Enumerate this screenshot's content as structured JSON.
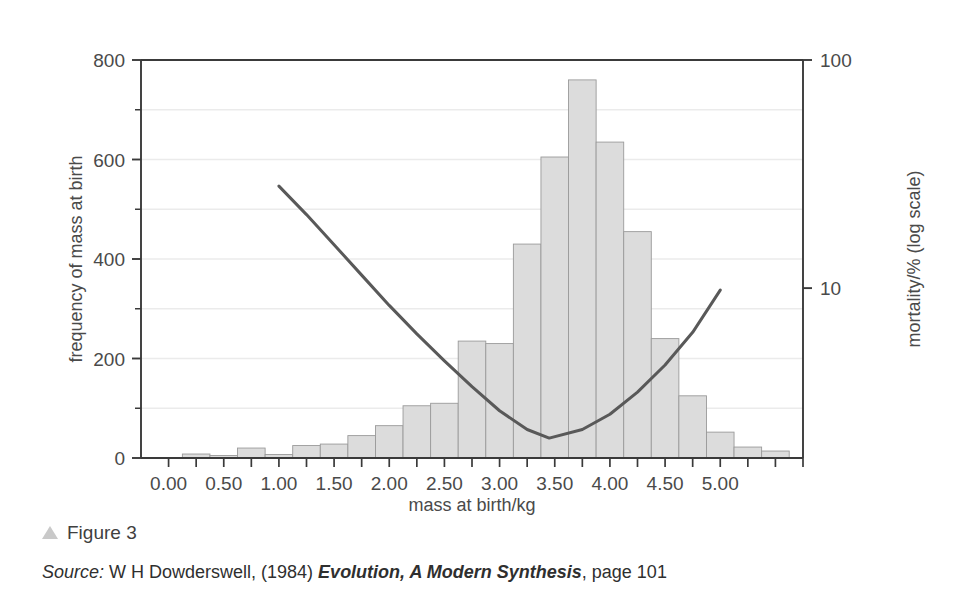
{
  "figure": {
    "marker_icon": "triangle-up-icon",
    "label": "Figure 3"
  },
  "source": {
    "prefix": "Source:",
    "author": " W H Dowderswell, (1984) ",
    "work": "Evolution, A Modern Synthesis",
    "suffix": ", page 101"
  },
  "colors": {
    "bar_fill": "#dcdcdc",
    "bar_stroke": "#9a9a9a",
    "curve": "#595959",
    "axis": "#3a3a3a",
    "grid": "#ebebeb",
    "text": "#4a4a4a",
    "marker": "#c9c9c9"
  },
  "chart_data": {
    "type": "bar",
    "title": "",
    "subtitle": "",
    "xlabel": "mass at birth/kg",
    "ylabel": "frequency of mass at birth",
    "y2label": "mortality/% (log scale)",
    "xlim": [
      -0.25,
      5.75
    ],
    "ylim": [
      0,
      800
    ],
    "y2lim": [
      1.8,
      100
    ],
    "y2scale": "log",
    "grid": true,
    "grid_step": 100,
    "legend": "none",
    "xticks": [
      0.0,
      0.25,
      0.5,
      0.75,
      1.0,
      1.25,
      1.5,
      1.75,
      2.0,
      2.25,
      2.5,
      2.75,
      3.0,
      3.25,
      3.5,
      3.75,
      4.0,
      4.25,
      4.5,
      4.75,
      5.0,
      5.25,
      5.5,
      5.75
    ],
    "xtick_labels": [
      "0.00",
      "0.50",
      "1.00",
      "1.50",
      "2.00",
      "2.50",
      "3.00",
      "3.50",
      "4.00",
      "4.50",
      "5.00"
    ],
    "xtick_label_values": [
      0.0,
      0.5,
      1.0,
      1.5,
      2.0,
      2.5,
      3.0,
      3.5,
      4.0,
      4.5,
      5.0
    ],
    "yticks": [
      0,
      200,
      400,
      600,
      800
    ],
    "ytick_labels": [
      "0",
      "200",
      "400",
      "600",
      "800"
    ],
    "y2ticks": [
      10,
      100
    ],
    "y2tick_labels": [
      "10",
      "100"
    ],
    "bar_width": 0.25,
    "categories": [
      0.25,
      0.5,
      0.75,
      1.0,
      1.25,
      1.5,
      1.75,
      2.0,
      2.25,
      2.5,
      2.75,
      3.0,
      3.25,
      3.5,
      3.75,
      4.0,
      4.25,
      4.5,
      4.75,
      5.0,
      5.25,
      5.5
    ],
    "values": [
      8,
      5,
      20,
      7,
      25,
      28,
      45,
      65,
      105,
      110,
      235,
      230,
      430,
      605,
      760,
      635,
      455,
      240,
      125,
      52,
      22,
      14
    ],
    "series": [
      {
        "name": "frequency of mass at birth",
        "type": "bar",
        "axis": "left",
        "bin_starts": [
          0.125,
          0.375,
          0.625,
          0.875,
          1.125,
          1.375,
          1.625,
          1.875,
          2.125,
          2.375,
          2.625,
          2.875,
          3.125,
          3.375,
          3.625,
          3.875,
          4.125,
          4.375,
          4.625,
          4.875,
          5.125,
          5.375
        ],
        "values": [
          8,
          5,
          20,
          7,
          25,
          28,
          45,
          65,
          105,
          110,
          235,
          230,
          430,
          605,
          760,
          635,
          455,
          240,
          125,
          52,
          22,
          14
        ]
      },
      {
        "name": "mortality/% (log scale)",
        "type": "line",
        "axis": "right",
        "x": [
          1.0,
          1.25,
          1.5,
          1.75,
          2.0,
          2.25,
          2.5,
          2.75,
          3.0,
          3.25,
          3.45,
          3.75,
          4.0,
          4.25,
          4.5,
          4.75,
          5.0
        ],
        "y": [
          28.0,
          21.0,
          15.5,
          11.4,
          8.4,
          6.3,
          4.8,
          3.7,
          2.9,
          2.4,
          2.2,
          2.4,
          2.8,
          3.5,
          4.6,
          6.4,
          9.8
        ]
      }
    ]
  }
}
